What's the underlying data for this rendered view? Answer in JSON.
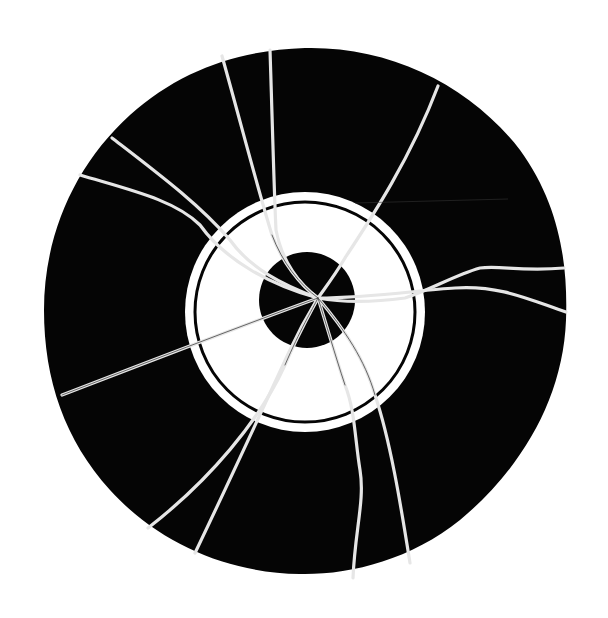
{
  "figure": {
    "colors": {
      "background": "#ffffff",
      "disc": "#050505",
      "ring": "#ffffff",
      "crack": "#e8e8e8"
    }
  }
}
